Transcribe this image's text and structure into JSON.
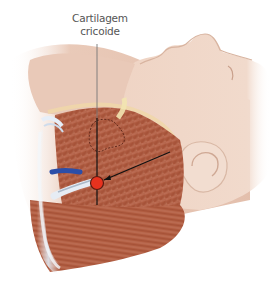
{
  "figure": {
    "label": {
      "line1": "Cartilagem",
      "line2": "cricoide"
    },
    "marker": {
      "x": 97,
      "y": 183,
      "color": "#e8321e"
    },
    "colors": {
      "skin": "#eed2c2",
      "skin_shadow": "#d9b3a0",
      "muscle": "#b0583c",
      "muscle_dark": "#8a3a24",
      "vessel_blue": "#2c4ea8",
      "tendon": "#e8eef4",
      "cartilage_yellow": "#f0e0a8",
      "line": "#111111",
      "leader_gray": "#777777"
    }
  }
}
